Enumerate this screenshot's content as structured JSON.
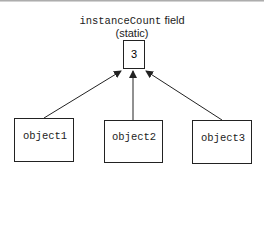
{
  "diagram": {
    "title_code": "instanceCount",
    "title_text": " field",
    "subtitle": "(static)",
    "static_value": "3",
    "objects": [
      {
        "label": "object1"
      },
      {
        "label": "object2"
      },
      {
        "label": "object3"
      }
    ],
    "colors": {
      "line": "#222222",
      "background": "#ffffff"
    }
  }
}
